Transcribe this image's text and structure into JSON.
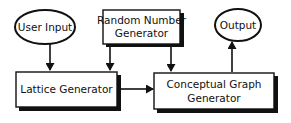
{
  "diagram": {
    "type": "flowchart",
    "colors": {
      "stroke": "#111111",
      "fill": "#ffffff",
      "shadow": "#111111",
      "text": "#111111"
    },
    "nodes": {
      "user_input": {
        "shape": "ellipse",
        "label": "User Input"
      },
      "random_number_generator": {
        "shape": "box",
        "line1": "Random Number",
        "line2": "Generator"
      },
      "lattice_generator": {
        "shape": "box",
        "label": "Lattice Generator"
      },
      "conceptual_graph_generator": {
        "shape": "box",
        "line1": "Conceptual Graph",
        "line2": "Generator"
      },
      "output": {
        "shape": "ellipse",
        "label": "Output"
      }
    },
    "edges": [
      {
        "from": "User Input",
        "to": "Lattice Generator"
      },
      {
        "from": "Random Number Generator",
        "to": "Lattice Generator"
      },
      {
        "from": "Random Number Generator",
        "to": "Conceptual Graph Generator"
      },
      {
        "from": "Lattice Generator",
        "to": "Conceptual Graph Generator"
      },
      {
        "from": "Conceptual Graph Generator",
        "to": "Output"
      }
    ]
  }
}
